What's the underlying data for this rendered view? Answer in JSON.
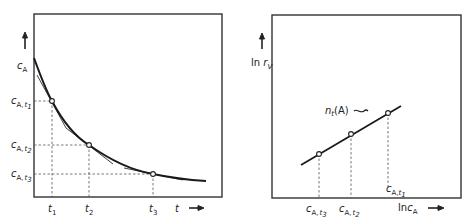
{
  "diagrams": [
    {
      "id": "concentration-vs-time",
      "y_axis": {
        "label": "c",
        "label_sub": "A",
        "arrow": "up-arrow"
      },
      "x_axis": {
        "label": "t",
        "arrow": "right-arrow"
      },
      "y_ticks": [
        {
          "main": "c",
          "sub": "A, t",
          "subsub": "1"
        },
        {
          "main": "c",
          "sub": "A, t",
          "subsub": "2"
        },
        {
          "main": "c",
          "sub": "A, t",
          "subsub": "3"
        }
      ],
      "x_ticks": [
        {
          "main": "t",
          "sub": "1"
        },
        {
          "main": "t",
          "sub": "2"
        },
        {
          "main": "t",
          "sub": "3"
        }
      ],
      "curve": "exponential decay with tangents at t1, t2, t3"
    },
    {
      "id": "ln-rate-vs-ln-concentration",
      "y_axis": {
        "label_prefix": "ln ",
        "label": "r",
        "label_sub": "V",
        "arrow": "up-arrow"
      },
      "x_axis": {
        "label_prefix": "ln",
        "label": "c",
        "label_sub": "A",
        "arrow": "right-arrow"
      },
      "line_label": {
        "main": "n",
        "sub": "t",
        "suffix": "(A)"
      },
      "x_ticks": [
        {
          "main": "c",
          "sub": "A, t",
          "subsub": "3"
        },
        {
          "main": "c",
          "sub": "A, t",
          "subsub": "2"
        },
        {
          "main": "c",
          "sub": "A, t",
          "subsub": "1"
        }
      ]
    }
  ]
}
